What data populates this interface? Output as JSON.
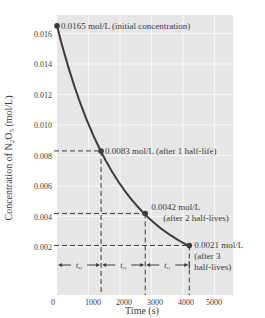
{
  "chart_data": {
    "type": "line",
    "title": "",
    "xlabel": "Time (s)",
    "ylabel": "Concentration of N2O5 (mol/L)",
    "ylabel_parts": {
      "pre": "Concentration of N",
      "sub1": "2",
      "mid": "O",
      "sub2": "5",
      "post": " (mol/L)"
    },
    "xlim": [
      0,
      5500
    ],
    "ylim": [
      0,
      0.017
    ],
    "x_ticks": [
      0,
      1000,
      2000,
      3000,
      4000,
      5000
    ],
    "x_tick_labels": [
      "0",
      "1000",
      "2000",
      "3000",
      "4000",
      "5000"
    ],
    "y_ticks": [
      0.002,
      0.004,
      0.006,
      0.008,
      0.01,
      0.012,
      0.014,
      0.016
    ],
    "y_tick_labels": [
      "0.002",
      "0.004",
      "0.006",
      "0.008",
      "0.010",
      "0.012",
      "0.014",
      "0.016"
    ],
    "grid": true,
    "legend": null,
    "series": [
      {
        "name": "[N2O5] vs time (first-order decay)",
        "x": [
          0,
          1400,
          2800,
          4200
        ],
        "y": [
          0.0165,
          0.0083,
          0.0042,
          0.0021
        ]
      }
    ],
    "annotations": [
      {
        "x": 0,
        "y": 0.0165,
        "lines": [
          "0.0165 mol/L (initial concentration)"
        ]
      },
      {
        "x": 1400,
        "y": 0.0083,
        "lines": [
          "0.0083 mol/L (after 1 half-life)"
        ]
      },
      {
        "x": 2800,
        "y": 0.0042,
        "lines": [
          "0.0042 mol/L",
          "(after 2 half-lives)"
        ]
      },
      {
        "x": 4200,
        "y": 0.0021,
        "lines": [
          "0.0021 mol/L",
          "(after 3",
          "half-lives)"
        ]
      }
    ],
    "half_life_markers": {
      "label": "t½",
      "intervals": [
        [
          0,
          1400
        ],
        [
          1400,
          2800
        ],
        [
          2800,
          4200
        ]
      ]
    },
    "colors": {
      "plot_background": "#e6e6e6",
      "grid": "#f7f7f7",
      "curve": "#3c3c3c",
      "dashes": "#3c3c3c",
      "text": "#3a3a3a"
    }
  }
}
